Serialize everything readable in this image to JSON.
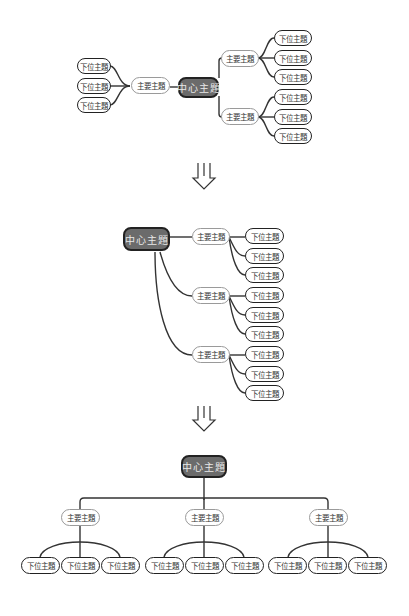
{
  "labels": {
    "central": "中心主題",
    "main": "主要主題",
    "sub": "下位主題"
  },
  "diagrams": [
    {
      "name": "mindmap-radial",
      "layout": "left-right",
      "main_topics": 3,
      "subtopics_per_main": 3
    },
    {
      "name": "mindmap-logic-right",
      "layout": "right-tree",
      "main_topics": 3,
      "subtopics_per_main": 3
    },
    {
      "name": "mindmap-org-chart",
      "layout": "top-down",
      "main_topics": 3,
      "subtopics_per_main": 3
    }
  ],
  "arrows": [
    {
      "name": "transition-arrow-1",
      "glyph": "⇓"
    },
    {
      "name": "transition-arrow-2",
      "glyph": "⇓"
    }
  ],
  "colors": {
    "central_fill": "#6b6b6b",
    "central_border": "#222222",
    "main_border": "#9a9a9a",
    "sub_border": "#222222",
    "line": "#333333"
  }
}
